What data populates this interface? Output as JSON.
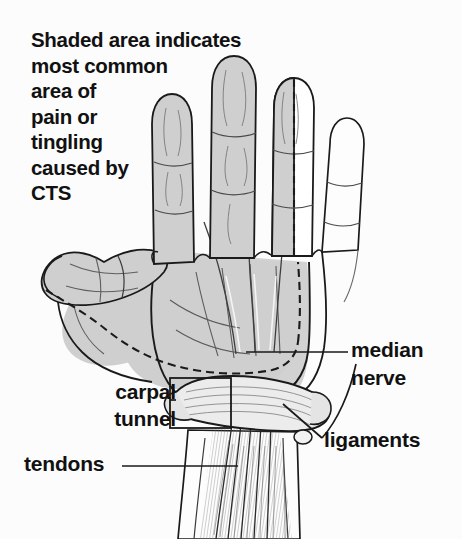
{
  "figure": {
    "caption_lines": [
      "Shaded area indicates",
      "most common",
      "area of",
      "pain or",
      "tingling",
      "caused by",
      "CTS"
    ],
    "labels": {
      "median_nerve_line1": "median",
      "median_nerve_line2": "nerve",
      "carpal_tunnel_line1": "carpal",
      "carpal_tunnel_line2": "tunnel",
      "ligaments": "ligaments",
      "tendons": "tendons"
    },
    "colors": {
      "background": "#fcfcfc",
      "ink": "#1a1a1a",
      "shaded_area": "#cfcfcf",
      "shaded_area_dark": "#bdbdbd",
      "unshaded_area": "#ffffff",
      "ligament_fill": "#e8e8e8",
      "text": "#111111"
    },
    "anatomy": {
      "shaded_digits": [
        "thumb",
        "index",
        "middle",
        "ring-half"
      ],
      "unshaded_digits": [
        "little"
      ],
      "structures": [
        "median nerve",
        "transverse carpal ligament",
        "flexor tendons",
        "carpal tunnel"
      ]
    }
  }
}
